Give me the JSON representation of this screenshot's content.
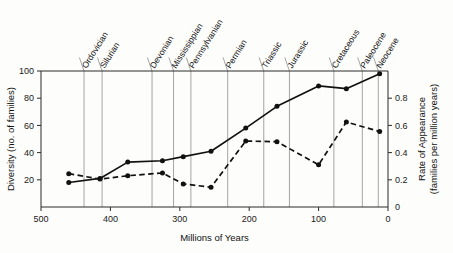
{
  "chart_data": {
    "type": "line",
    "title": "",
    "xlabel": "Millions of Years",
    "ylabel": "Diversity (no. of families)",
    "y2label_line1": "Rate of Appearance",
    "y2label_line2": "(families per million years)",
    "xlim": [
      500,
      0
    ],
    "ylim": [
      0,
      100
    ],
    "y2lim": [
      0,
      1.0
    ],
    "xticks": [
      500,
      400,
      300,
      200,
      100,
      0
    ],
    "xticklabels": [
      "500",
      "400",
      "300",
      "200",
      "100",
      "0"
    ],
    "yticks": [
      20,
      40,
      60,
      80,
      100
    ],
    "yticklabels": [
      "20",
      "40",
      "60",
      "80",
      "100"
    ],
    "y2ticks": [
      0,
      0.2,
      0.4,
      0.6,
      0.8
    ],
    "y2ticklabels": [
      "0",
      "0.2",
      "0.4",
      "0.6",
      "0.8"
    ],
    "grid": "vertical-period-dividers",
    "legend": "none",
    "series": [
      {
        "name": "Diversity",
        "axis": "left",
        "style": "solid",
        "marker": "filled-circle",
        "x": [
          460,
          415,
          375,
          325,
          295,
          255,
          205,
          160,
          100,
          60,
          12
        ],
        "values": [
          18,
          21,
          33,
          34,
          37,
          41,
          58,
          74,
          89,
          87,
          98
        ]
      },
      {
        "name": "Rate of Appearance",
        "axis": "right",
        "style": "dashed",
        "marker": "filled-circle",
        "x": [
          460,
          415,
          375,
          325,
          295,
          255,
          205,
          160,
          100,
          60,
          12
        ],
        "values": [
          0.245,
          0.205,
          0.23,
          0.25,
          0.17,
          0.145,
          0.485,
          0.48,
          0.31,
          0.625,
          0.555
        ]
      }
    ],
    "periods": [
      {
        "label": "Ordovician",
        "start": 500,
        "end": 438
      },
      {
        "label": "Silurian",
        "start": 438,
        "end": 408
      },
      {
        "label": "Devonian",
        "start": 408,
        "end": 360
      },
      {
        "label": "Mississippian",
        "start": 360,
        "end": 320
      },
      {
        "label": "Pennsylvanian",
        "start": 320,
        "end": 286
      },
      {
        "label": "Permian",
        "start": 286,
        "end": 248
      },
      {
        "label": "Triassic",
        "start": 248,
        "end": 213
      },
      {
        "label": "Jurassic",
        "start": 213,
        "end": 144
      },
      {
        "label": "Cretaceous",
        "start": 144,
        "end": 65
      },
      {
        "label": "Paleocene",
        "start": 65,
        "end": 24
      },
      {
        "label": "Neocene",
        "start": 24,
        "end": 0
      }
    ],
    "period_divider_positions": [
      438,
      412,
      340,
      309,
      284,
      231,
      179,
      142,
      78,
      37,
      14
    ],
    "colors": {
      "line": "#111111",
      "axis": "#2a2a2a",
      "divider": "#9a9a9a",
      "background": "#fdfdfb"
    }
  }
}
